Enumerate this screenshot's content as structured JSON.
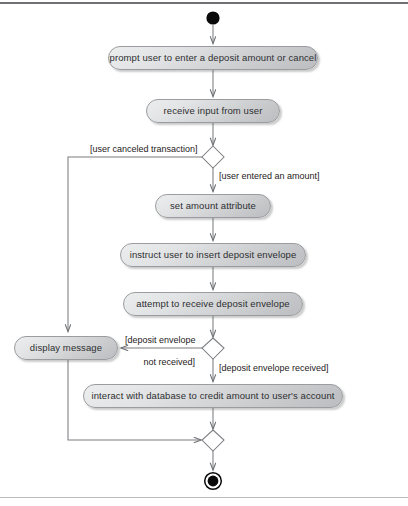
{
  "diagram": {
    "type": "uml-activity-diagram",
    "title": "",
    "colors": {
      "node_fill_light": "#eceded",
      "node_fill_dark": "#bcbdc0",
      "node_border": "#9a9c9f",
      "line": "#7b7d80",
      "text": "#2d2f31",
      "terminal_fill": "#000000",
      "frame_rule_top": "#6f7174",
      "frame_rule_bottom": "#b9bbbe"
    },
    "nodes": [
      {
        "id": "start",
        "kind": "initial-node",
        "label": ""
      },
      {
        "id": "prompt",
        "kind": "action",
        "label": "prompt user to enter a deposit amount or cancel"
      },
      {
        "id": "receive-input",
        "kind": "action",
        "label": "receive input from user"
      },
      {
        "id": "decision-input",
        "kind": "decision-node",
        "label": ""
      },
      {
        "id": "set-amount",
        "kind": "action",
        "label": "set amount attribute"
      },
      {
        "id": "instruct-insert",
        "kind": "action",
        "label": "instruct user to insert deposit envelope"
      },
      {
        "id": "attempt-receive",
        "kind": "action",
        "label": "attempt to receive deposit envelope"
      },
      {
        "id": "decision-envelope",
        "kind": "decision-node",
        "label": ""
      },
      {
        "id": "display-message",
        "kind": "action",
        "label": "display message"
      },
      {
        "id": "interact-database",
        "kind": "action",
        "label": "interact with database to credit amount to user's account"
      },
      {
        "id": "merge",
        "kind": "merge-node",
        "label": ""
      },
      {
        "id": "end",
        "kind": "final-node",
        "label": ""
      }
    ],
    "guards": {
      "user_canceled": "[user canceled transaction]",
      "user_entered_amount": "[user entered an amount]",
      "envelope_not_received_line1": "[deposit envelope",
      "envelope_not_received_line2": "not received]",
      "envelope_received": "[deposit envelope received]"
    }
  }
}
